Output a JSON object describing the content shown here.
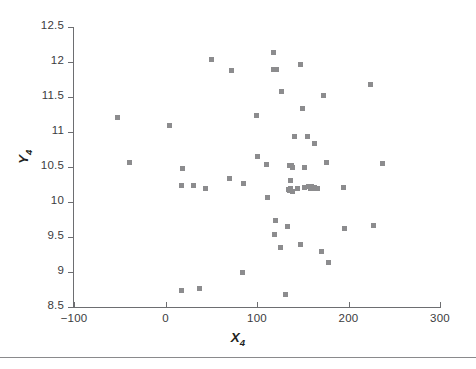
{
  "figure": {
    "width": 476,
    "height": 369,
    "background": "#ffffff",
    "marker_color": "#8c8c8e",
    "axis_color": "#6d6e71",
    "text_color": "#231f20",
    "rule_color": "#8a8a8c"
  },
  "axis_titles": {
    "x_base": "X",
    "x_sub": "4",
    "y_base": "Y",
    "y_sub": "4"
  },
  "chart_data": {
    "type": "scatter",
    "title": "",
    "xlabel": "X4",
    "ylabel": "Y4",
    "xlim": [
      -100,
      300
    ],
    "ylim": [
      8.5,
      12.5
    ],
    "xticks": [
      -100,
      0,
      100,
      200,
      300
    ],
    "yticks": [
      8.5,
      9,
      9.5,
      10,
      10.5,
      11,
      11.5,
      12,
      12.5
    ],
    "xtick_labels": [
      "−100",
      "0",
      "100",
      "200",
      "300"
    ],
    "ytick_labels": [
      "8.5",
      "9",
      "9.5",
      "10",
      "10.5",
      "11",
      "11.5",
      "12",
      "12.5"
    ],
    "grid": false,
    "legend": false,
    "marker": "square",
    "marker_size": 5,
    "n_points": 60,
    "points": [
      {
        "x": -52,
        "y": 11.21
      },
      {
        "x": -39,
        "y": 10.57
      },
      {
        "x": 4,
        "y": 11.09
      },
      {
        "x": 18,
        "y": 10.23
      },
      {
        "x": 17,
        "y": 8.74
      },
      {
        "x": 19,
        "y": 10.48
      },
      {
        "x": 31,
        "y": 10.23
      },
      {
        "x": 37,
        "y": 8.76
      },
      {
        "x": 44,
        "y": 10.2
      },
      {
        "x": 50,
        "y": 12.04
      },
      {
        "x": 70,
        "y": 10.34
      },
      {
        "x": 72,
        "y": 11.88
      },
      {
        "x": 85,
        "y": 10.26
      },
      {
        "x": 84,
        "y": 8.99
      },
      {
        "x": 99,
        "y": 11.24
      },
      {
        "x": 101,
        "y": 10.65
      },
      {
        "x": 110,
        "y": 10.53
      },
      {
        "x": 111,
        "y": 10.07
      },
      {
        "x": 118,
        "y": 12.14
      },
      {
        "x": 118,
        "y": 11.9
      },
      {
        "x": 120,
        "y": 9.74
      },
      {
        "x": 119,
        "y": 9.53
      },
      {
        "x": 127,
        "y": 11.58
      },
      {
        "x": 126,
        "y": 9.35
      },
      {
        "x": 131,
        "y": 8.68
      },
      {
        "x": 133,
        "y": 9.65
      },
      {
        "x": 136,
        "y": 10.52
      },
      {
        "x": 138,
        "y": 10.52
      },
      {
        "x": 137,
        "y": 10.31
      },
      {
        "x": 136,
        "y": 10.17
      },
      {
        "x": 139,
        "y": 10.15
      },
      {
        "x": 141,
        "y": 10.94
      },
      {
        "x": 144,
        "y": 10.2
      },
      {
        "x": 147,
        "y": 11.96
      },
      {
        "x": 148,
        "y": 9.39
      },
      {
        "x": 150,
        "y": 11.34
      },
      {
        "x": 152,
        "y": 10.49
      },
      {
        "x": 152,
        "y": 10.21
      },
      {
        "x": 155,
        "y": 10.93
      },
      {
        "x": 158,
        "y": 10.2
      },
      {
        "x": 160,
        "y": 10.22
      },
      {
        "x": 161,
        "y": 10.2
      },
      {
        "x": 163,
        "y": 10.84
      },
      {
        "x": 164,
        "y": 10.2
      },
      {
        "x": 166,
        "y": 10.2
      },
      {
        "x": 170,
        "y": 9.3
      },
      {
        "x": 173,
        "y": 11.52
      },
      {
        "x": 176,
        "y": 10.57
      },
      {
        "x": 178,
        "y": 9.14
      },
      {
        "x": 195,
        "y": 10.21
      },
      {
        "x": 196,
        "y": 9.62
      },
      {
        "x": 224,
        "y": 11.68
      },
      {
        "x": 227,
        "y": 9.66
      },
      {
        "x": 237,
        "y": 10.55
      },
      {
        "x": 121,
        "y": 11.9
      },
      {
        "x": 134,
        "y": 10.18
      },
      {
        "x": 156,
        "y": 10.22
      },
      {
        "x": 139,
        "y": 10.5
      },
      {
        "x": 163,
        "y": 10.21
      },
      {
        "x": 137,
        "y": 10.19
      }
    ]
  }
}
